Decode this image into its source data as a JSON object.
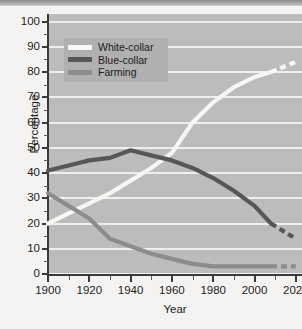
{
  "chart_data": {
    "type": "line",
    "title": "",
    "xlabel": "Year",
    "ylabel": "Percentage",
    "xlim": [
      1900,
      2023
    ],
    "ylim": [
      0,
      103
    ],
    "grid": true,
    "legend_position": "upper-left-inside",
    "x_ticks": [
      1900,
      1920,
      1940,
      1960,
      1980,
      2000,
      2020
    ],
    "x_minor_ticks": [
      1910,
      1930,
      1950,
      1970,
      1990,
      2010
    ],
    "y_ticks": [
      0,
      10,
      20,
      30,
      40,
      50,
      60,
      70,
      80,
      90,
      100
    ],
    "x": [
      1900,
      1910,
      1920,
      1930,
      1940,
      1950,
      1960,
      1970,
      1980,
      1990,
      2000,
      2008
    ],
    "series": [
      {
        "name": "White-collar",
        "color": "#f7f6f3",
        "values": [
          20,
          24,
          28,
          32,
          37,
          42,
          48,
          60,
          68,
          74,
          78,
          80
        ],
        "projection_x": [
          2008,
          2014,
          2020
        ],
        "projection_values": [
          80,
          82,
          84
        ]
      },
      {
        "name": "Blue-collar",
        "color": "#575757",
        "values": [
          41,
          43,
          45,
          46,
          49,
          47,
          45,
          42,
          38,
          33,
          27,
          20
        ],
        "projection_x": [
          2008,
          2014,
          2020
        ],
        "projection_values": [
          20,
          17,
          14
        ]
      },
      {
        "name": "Farming",
        "color": "#8c8c8c",
        "values": [
          32,
          27,
          22,
          14,
          11,
          8,
          6,
          4,
          3,
          3,
          3,
          3
        ],
        "projection_x": [
          2008,
          2014,
          2020
        ],
        "projection_values": [
          3,
          3,
          3
        ]
      }
    ],
    "annotations": [
      "Dashed line segments after 2008 indicate projected values."
    ]
  },
  "axes": {
    "y_tick_labels": [
      "100",
      "90",
      "80",
      "70",
      "60",
      "50",
      "40",
      "30",
      "20",
      "10",
      "0"
    ],
    "x_tick_labels": [
      "1900",
      "1920",
      "1940",
      "1960",
      "1980",
      "2000",
      "2020"
    ],
    "y_title": "Percentage",
    "x_title": "Year"
  },
  "legend": {
    "items": [
      {
        "label": "White-collar",
        "color": "#f7f6f3"
      },
      {
        "label": "Blue-collar",
        "color": "#575757"
      },
      {
        "label": "Farming",
        "color": "#8c8c8c"
      }
    ]
  },
  "colors": {
    "page_background": "#f4f3f1",
    "plot_background": "#bcbcbc",
    "gridline": "#f0efed",
    "axis": "#3a3a3a",
    "legend_background": "#b0b0b0",
    "text": "#1c1c1c"
  }
}
